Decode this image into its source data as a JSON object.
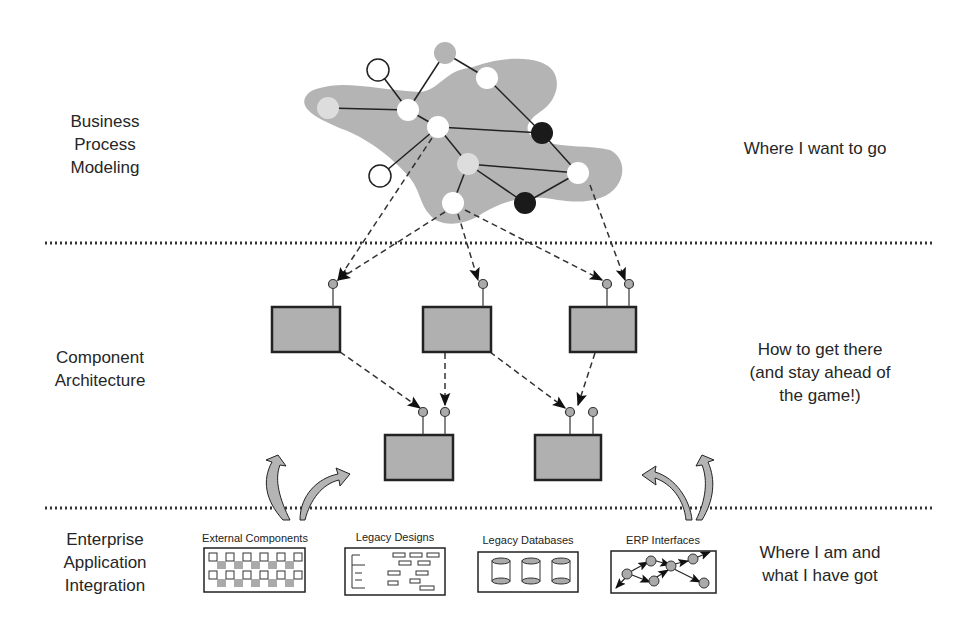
{
  "layers": [
    {
      "left_label": [
        "Business",
        "Process",
        "Modeling"
      ],
      "right_label": [
        "Where I want to go"
      ]
    },
    {
      "left_label": [
        "Component",
        "Architecture"
      ],
      "right_label": [
        "How to get there",
        "(and stay ahead of",
        "the game!)"
      ]
    },
    {
      "left_label": [
        "Enterprise",
        "Application",
        "Integration"
      ],
      "right_label": [
        "Where I am and",
        "what I have got"
      ]
    }
  ],
  "sources": [
    {
      "label": "External Components"
    },
    {
      "label": "Legacy Designs"
    },
    {
      "label": "Legacy Databases"
    },
    {
      "label": "ERP Interfaces"
    }
  ],
  "colors": {
    "blob": "#b4b4b4",
    "component": "#b0b0b0",
    "node_dark": "#1a1a1a",
    "node_light": "#d9d9d9",
    "separator": "#333333"
  }
}
